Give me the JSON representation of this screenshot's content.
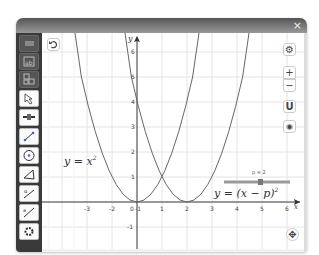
{
  "window": {
    "close_label": "×"
  },
  "toolbar": {
    "tools": [
      {
        "name": "menu",
        "icon": "menu-icon"
      },
      {
        "name": "algebra-view",
        "icon": "algebra-icon"
      },
      {
        "name": "tools-view",
        "icon": "tools-icon"
      },
      {
        "name": "move",
        "icon": "move-arrow-icon"
      },
      {
        "name": "slider",
        "icon": "slider-icon"
      },
      {
        "name": "line",
        "icon": "line-icon"
      },
      {
        "name": "circle",
        "icon": "circle-icon"
      },
      {
        "name": "polygon",
        "icon": "polygon-icon"
      },
      {
        "name": "angle",
        "icon": "angle-icon"
      },
      {
        "name": "segment",
        "icon": "segment-icon"
      },
      {
        "name": "settings",
        "icon": "gear-icon"
      }
    ],
    "undo_icon": "undo-icon"
  },
  "graphics": {
    "x_ticks": [
      "-3",
      "-2",
      "-1",
      "0",
      "1",
      "2",
      "3",
      "4",
      "5",
      "6"
    ],
    "y_ticks": [
      "-1",
      "1",
      "2",
      "3",
      "4",
      "5",
      "6"
    ],
    "x_axis_label": "x",
    "y_axis_label": "y",
    "curve1_label": "y = x",
    "curve1_exp": "2",
    "curve2_label": "y = (x − p)",
    "curve2_exp": "2",
    "slider": {
      "label": "p = 2",
      "value": 2
    }
  },
  "side_buttons": {
    "settings": "⚙",
    "zoom_in": "+",
    "zoom_out": "−",
    "home": "U",
    "screenshot": "◉",
    "fullscreen": "✥"
  }
}
